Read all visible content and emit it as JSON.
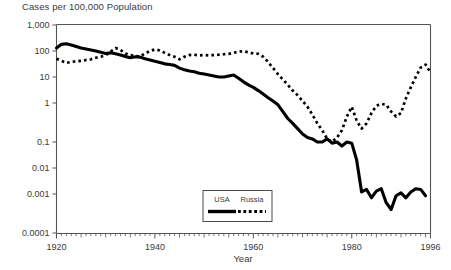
{
  "chart_data": {
    "type": "line",
    "title": "Cases per 100,000 Population",
    "xlabel": "Year",
    "ylabel": "",
    "yscale": "log",
    "ylim": [
      0.0001,
      1000
    ],
    "xlim": [
      1920,
      1996
    ],
    "grid": false,
    "legend_position": "bottom-center",
    "ytick_labels": [
      "1,000",
      "100",
      "10",
      "1",
      "0.1",
      "0.01",
      "0.001",
      "0.0001"
    ],
    "ytick_values": [
      1000,
      100,
      10,
      1,
      0.1,
      0.01,
      0.001,
      0.0001
    ],
    "xtick_labels": [
      "1920",
      "1940",
      "1960",
      "1980",
      "1996"
    ],
    "xtick_values": [
      1920,
      1940,
      1960,
      1980,
      1996
    ],
    "series": [
      {
        "name": "USA",
        "style": "solid",
        "color": "#000000",
        "x": [
          1920,
          1921,
          1922,
          1923,
          1924,
          1925,
          1926,
          1927,
          1928,
          1929,
          1930,
          1931,
          1932,
          1933,
          1934,
          1935,
          1936,
          1937,
          1938,
          1939,
          1940,
          1941,
          1942,
          1943,
          1944,
          1945,
          1946,
          1947,
          1948,
          1949,
          1950,
          1951,
          1952,
          1953,
          1954,
          1955,
          1956,
          1957,
          1958,
          1959,
          1960,
          1961,
          1962,
          1963,
          1964,
          1965,
          1966,
          1967,
          1968,
          1969,
          1970,
          1971,
          1972,
          1973,
          1974,
          1975,
          1976,
          1977,
          1978,
          1979,
          1980,
          1981,
          1982,
          1983,
          1984,
          1985,
          1986,
          1987,
          1988,
          1989,
          1990,
          1991,
          1992,
          1993,
          1994,
          1995
        ],
        "values": [
          130,
          180,
          190,
          170,
          150,
          130,
          120,
          110,
          100,
          90,
          80,
          85,
          78,
          70,
          62,
          55,
          60,
          58,
          50,
          45,
          40,
          36,
          32,
          30,
          28,
          22,
          19,
          17,
          16,
          14,
          13,
          12,
          11,
          10,
          10,
          11,
          12,
          9,
          6.5,
          5,
          4,
          3,
          2.2,
          1.6,
          1.2,
          0.9,
          0.6,
          0.4,
          0.3,
          0.22,
          0.16,
          0.13,
          0.12,
          0.1,
          0.1,
          0.12,
          0.09,
          0.1,
          0.07,
          0.1,
          0.09,
          0.02,
          0.0012,
          0.0015,
          0.0008,
          0.0013,
          0.0016,
          0.0006,
          0.0004,
          0.0009,
          0.0011,
          0.0008,
          0.0012,
          0.0016,
          0.0015,
          0.0009
        ]
      },
      {
        "name": "Russia",
        "style": "dashed",
        "color": "#000000",
        "x": [
          1920,
          1921,
          1922,
          1923,
          1924,
          1925,
          1926,
          1927,
          1928,
          1929,
          1930,
          1931,
          1932,
          1933,
          1934,
          1935,
          1936,
          1937,
          1938,
          1939,
          1940,
          1941,
          1942,
          1943,
          1944,
          1945,
          1946,
          1947,
          1948,
          1949,
          1950,
          1951,
          1952,
          1953,
          1954,
          1955,
          1956,
          1957,
          1958,
          1959,
          1960,
          1961,
          1962,
          1963,
          1964,
          1965,
          1966,
          1967,
          1968,
          1969,
          1970,
          1971,
          1972,
          1973,
          1974,
          1975,
          1976,
          1977,
          1978,
          1979,
          1980,
          1981,
          1982,
          1983,
          1984,
          1985,
          1986,
          1987,
          1988,
          1989,
          1990,
          1991,
          1992,
          1993,
          1994,
          1995,
          1996
        ],
        "values": [
          50,
          42,
          35,
          38,
          40,
          42,
          45,
          48,
          55,
          60,
          70,
          95,
          130,
          110,
          80,
          70,
          65,
          62,
          80,
          100,
          115,
          105,
          85,
          70,
          60,
          48,
          60,
          70,
          72,
          68,
          70,
          68,
          70,
          72,
          75,
          78,
          85,
          95,
          98,
          90,
          80,
          78,
          60,
          38,
          22,
          13,
          8,
          5,
          3,
          2,
          1.2,
          0.8,
          0.5,
          0.3,
          0.2,
          0.12,
          0.1,
          0.13,
          0.2,
          0.45,
          0.8,
          0.35,
          0.22,
          0.3,
          0.55,
          0.85,
          0.95,
          0.9,
          0.6,
          0.45,
          0.55,
          1.5,
          4,
          10,
          23,
          30,
          15
        ]
      }
    ]
  },
  "legend": {
    "items": [
      {
        "label": "USA",
        "style": "solid"
      },
      {
        "label": "Russia",
        "style": "dashed"
      }
    ]
  }
}
